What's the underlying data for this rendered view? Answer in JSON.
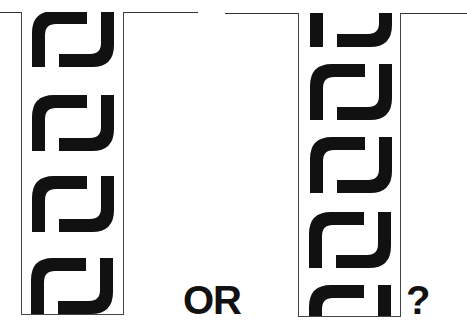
{
  "figure": {
    "connector_text": "OR",
    "question_text": "?",
    "ink_color": "#111111",
    "line_color": "#333333"
  },
  "left_option": {
    "glyph_count": 4,
    "glyph_name": "interlocking-hook-glyph"
  },
  "right_option": {
    "glyph_count": 5,
    "first_glyph_cropped": true,
    "last_glyph_cropped": true,
    "glyph_name": "interlocking-hook-glyph"
  }
}
